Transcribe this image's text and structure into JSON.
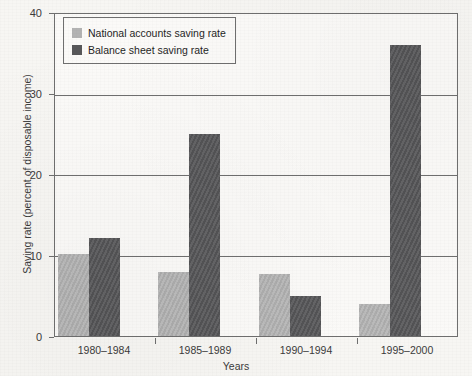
{
  "chart_data": {
    "type": "bar",
    "title": "",
    "xlabel": "Years",
    "ylabel": "Saving rate (percent of disposable income)",
    "categories": [
      "1980–1984",
      "1985–1989",
      "1990–1994",
      "1995–2000"
    ],
    "series": [
      {
        "name": "National accounts saving rate",
        "color": "#b3b3b3",
        "values": [
          10.2,
          8.0,
          7.7,
          4.0
        ]
      },
      {
        "name": "Balance sheet saving rate",
        "color": "#58585a",
        "values": [
          12.2,
          25.1,
          5.0,
          36.1
        ]
      }
    ],
    "ylim": [
      0,
      40
    ],
    "yticks": [
      0,
      10,
      20,
      30,
      40
    ],
    "ytick_labels": [
      "0",
      "10",
      "20",
      "30",
      "40"
    ],
    "grid": true,
    "legend_position": "top-left"
  },
  "axes": {
    "y_title": "Saving rate (percent of disposable income)",
    "x_title": "Years"
  },
  "legend": {
    "entries": [
      {
        "label": "National accounts saving rate",
        "swatch": "light"
      },
      {
        "label": "Balance sheet saving rate",
        "swatch": "dark"
      }
    ]
  },
  "ticks": {
    "y": [
      "40",
      "30",
      "20",
      "10",
      "0"
    ],
    "x": [
      "1980–1984",
      "1985–1989",
      "1990–1994",
      "1995–2000"
    ]
  },
  "colors": {
    "series_light": "#b3b3b3",
    "series_dark": "#58585a",
    "axis": "#6f6f6f",
    "background": "#f7f6f3",
    "text": "#3b3b3b"
  }
}
